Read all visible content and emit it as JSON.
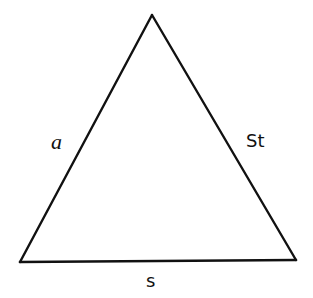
{
  "diagram": {
    "type": "triangle",
    "stroke_color": "#111111",
    "background_color": "#ffffff",
    "vertices": {
      "apex": [
        152,
        15
      ],
      "bottom_left": [
        20,
        262
      ],
      "bottom_right": [
        296,
        260
      ]
    },
    "labels": {
      "left_side": "a",
      "right_side": "St",
      "bottom_side": "s"
    }
  }
}
